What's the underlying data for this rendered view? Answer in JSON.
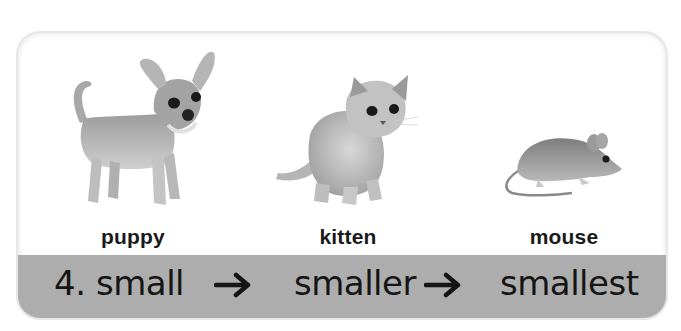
{
  "exercise": {
    "number": "4.",
    "animals": [
      {
        "name": "puppy",
        "icon": "puppy-illustration"
      },
      {
        "name": "kitten",
        "icon": "kitten-illustration"
      },
      {
        "name": "mouse",
        "icon": "mouse-illustration"
      }
    ],
    "comparison": [
      "small",
      "smaller",
      "smallest"
    ],
    "arrow_icon": "right-arrow-icon"
  },
  "colors": {
    "band": "#adadad",
    "text": "#151515",
    "card_border": "#e6e6e6"
  }
}
